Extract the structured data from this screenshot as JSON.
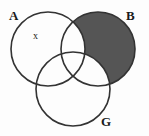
{
  "figure": {
    "type": "venn-diagram",
    "title": "",
    "background_color": "#fdfdfd",
    "stroke_color": "#333333",
    "shade_color": "#555555",
    "set_count": 3
  },
  "sets": [
    {
      "key": "A",
      "label": "A",
      "cx": 48,
      "cy": 49,
      "r": 37,
      "label_x": 9,
      "label_y": 9
    },
    {
      "key": "B",
      "label": "B",
      "cx": 98,
      "cy": 49,
      "r": 37,
      "label_x": 126,
      "label_y": 9
    },
    {
      "key": "G",
      "label": "G",
      "cx": 73,
      "cy": 89,
      "r": 37,
      "label_x": 101,
      "label_y": 115
    }
  ],
  "annotations": [
    {
      "key": "x",
      "label": "x",
      "region": "A only",
      "x": 33,
      "y": 31
    }
  ],
  "shading": {
    "region_description": "B only (B minus A and minus G)",
    "color": "#555555",
    "filled_sets": [
      "B"
    ],
    "excluded_sets": [
      "A",
      "G"
    ]
  }
}
